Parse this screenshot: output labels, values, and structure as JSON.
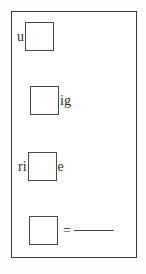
{
  "document": {
    "type": "worksheet",
    "title": "Fill-in-the-blank letter exercise",
    "border_color": "#3a3a3a",
    "box_border_color": "#4a4a4a",
    "text_color": "#2b2b2b",
    "background_color": "#ffffff"
  },
  "rows": [
    {
      "index": 1,
      "text_before": "u",
      "box_value": "",
      "text_after": "",
      "has_equals": false,
      "has_blank_line": false
    },
    {
      "index": 2,
      "text_before": "",
      "box_value": "",
      "text_after": "ig",
      "has_equals": false,
      "has_blank_line": false
    },
    {
      "index": 3,
      "text_before": "ri",
      "box_value": "",
      "text_after": "e",
      "has_equals": false,
      "has_blank_line": false
    },
    {
      "index": 4,
      "text_before": "",
      "box_value": "",
      "text_after": "",
      "has_equals": true,
      "equals_label": "=",
      "has_blank_line": true
    }
  ]
}
